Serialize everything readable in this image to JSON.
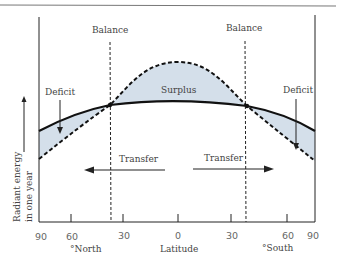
{
  "diagram": {
    "labels": {
      "balance_left": "Balance",
      "balance_right": "Balance",
      "surplus": "Surplus",
      "deficit_left": "Deficit",
      "deficit_right": "Deficit",
      "transfer_left": "Transfer",
      "transfer_right": "Transfer",
      "y_axis_line1": "Radiant energy",
      "y_axis_line2": "in one year",
      "x_axis": "Latitude",
      "north": "°North",
      "south": "°South"
    },
    "x_ticks": [
      "90",
      "60",
      "30",
      "0",
      "30",
      "60",
      "90"
    ],
    "series": [
      {
        "name": "outgoing radiation",
        "style": "solid"
      },
      {
        "name": "incoming radiation",
        "style": "dashed"
      }
    ],
    "colors": {
      "fill": "#d4dfea",
      "line": "#111111",
      "text": "#444444"
    }
  }
}
